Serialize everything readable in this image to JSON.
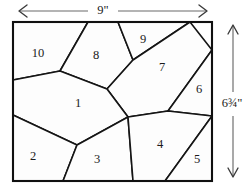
{
  "figure": {
    "background_color": "#ffffff",
    "line_color": "#151515",
    "fill_color": "#fdfdfd",
    "dimension_line_color": "#6a6a6a"
  },
  "dimensions": {
    "width": {
      "label": "9\"",
      "orientation": "horizontal",
      "position": "top",
      "arrow_style": "double-headed"
    },
    "height": {
      "label": "6¾\"",
      "orientation": "vertical",
      "position": "right",
      "arrow_style": "double-headed"
    }
  },
  "rectangle": {
    "x_left": 13,
    "y_top": 22,
    "x_right": 212,
    "y_bottom": 181
  },
  "regions": [
    {
      "number": "1",
      "label_x": 78,
      "label_y": 104,
      "points": "13,80 60,71 107,89 128,117 77,145 13,115"
    },
    {
      "number": "2",
      "label_x": 33,
      "label_y": 157,
      "points": "13,115 77,145 63,181 13,181"
    },
    {
      "number": "3",
      "label_x": 97,
      "label_y": 160,
      "points": "77,145 128,117 133,181 63,181"
    },
    {
      "number": "4",
      "label_x": 160,
      "label_y": 145,
      "points": "128,117 168,111 212,116 165,181 133,181"
    },
    {
      "number": "5",
      "label_x": 197,
      "label_y": 160,
      "points": "212,116 212,181 165,181"
    },
    {
      "number": "6",
      "label_x": 199,
      "label_y": 90
    },
    {
      "number": "7",
      "label_x": 162,
      "label_y": 68
    },
    {
      "number": "8",
      "label_x": 96,
      "label_y": 56
    },
    {
      "number": "9",
      "label_x": 143,
      "label_y": 40
    },
    {
      "number": "10",
      "label_x": 38,
      "label_y": 54
    }
  ],
  "edges": {
    "top_vertices": [
      88,
      118,
      190
    ],
    "left_vertices": [
      80,
      115
    ],
    "bottom_vertices": [
      63,
      133,
      165
    ],
    "right_vertices": [
      116
    ]
  }
}
